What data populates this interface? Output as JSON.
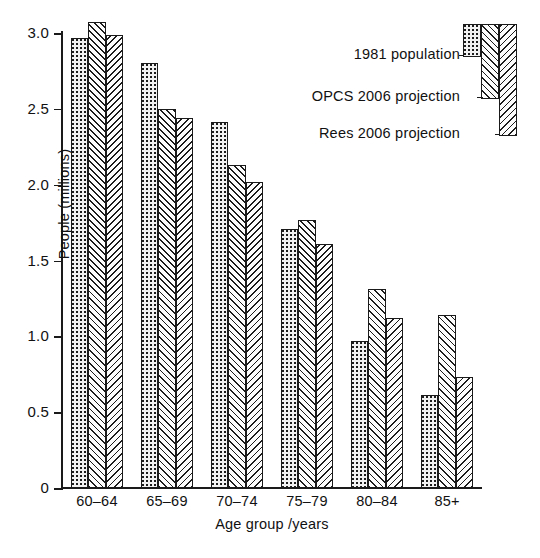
{
  "chart_data": {
    "type": "bar",
    "title": "",
    "xlabel": "Age group /years",
    "ylabel": "People (millions)",
    "categories": [
      "60–64",
      "65–69",
      "70–74",
      "75–79",
      "80–84",
      "85+"
    ],
    "series": [
      {
        "name": "1981 population",
        "pattern": "dots",
        "values": [
          2.97,
          2.8,
          2.41,
          1.71,
          0.97,
          0.61
        ]
      },
      {
        "name": "OPCS 2006 projection",
        "pattern": "forward-diagonal",
        "values": [
          3.07,
          2.5,
          2.13,
          1.77,
          1.31,
          1.14
        ]
      },
      {
        "name": "Rees 2006 projection",
        "pattern": "backward-diagonal",
        "values": [
          2.99,
          2.44,
          2.02,
          1.61,
          1.12,
          0.73
        ]
      }
    ],
    "ylim": [
      0,
      3.0
    ],
    "yticks": [
      "0",
      "0.5",
      "1.0",
      "1.5",
      "2.0",
      "2.5",
      "3.0"
    ],
    "ytick_values": [
      0,
      0.5,
      1.0,
      1.5,
      2.0,
      2.5,
      3.0
    ],
    "grid": false,
    "legend_position": "top-right",
    "axis_color": "#1a1a1a"
  },
  "legend": {
    "items": [
      {
        "label": "1981 population"
      },
      {
        "label": "OPCS 2006 projection"
      },
      {
        "label": "Rees 2006 projection"
      }
    ]
  },
  "caption": {
    "partial_text": ""
  }
}
